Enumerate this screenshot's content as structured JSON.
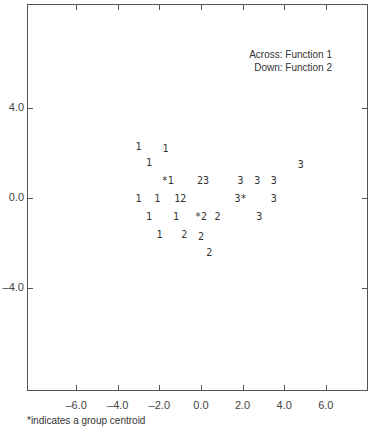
{
  "chart_data": {
    "type": "scatter",
    "title": "",
    "legend": [
      "Across: Function 1",
      "Down: Function 2"
    ],
    "xlabel": "Function 1",
    "ylabel": "Function 2",
    "x_ticks": [
      "-6.0",
      "-4.0",
      "-2.0",
      "0.0",
      "2.0",
      "4.0",
      "6.0"
    ],
    "y_ticks": [
      "4.0",
      "0.0",
      "-4.0"
    ],
    "xlim": [
      -8.2,
      8.2
    ],
    "ylim": [
      -8.5,
      8.5
    ],
    "grid": false,
    "footnote": "*indicates a group centroid",
    "points": [
      {
        "label": "1",
        "x": -3.0,
        "y": 2.3
      },
      {
        "label": "1",
        "x": -1.7,
        "y": 2.2
      },
      {
        "label": "1",
        "x": -2.5,
        "y": 1.6
      },
      {
        "label": "*1",
        "x": -1.6,
        "y": 0.8
      },
      {
        "label": "23",
        "x": 0.1,
        "y": 0.8
      },
      {
        "label": "3",
        "x": 1.9,
        "y": 0.8
      },
      {
        "label": "3",
        "x": 2.7,
        "y": 0.8
      },
      {
        "label": "3",
        "x": 3.5,
        "y": 0.8
      },
      {
        "label": "3",
        "x": 4.8,
        "y": 1.5
      },
      {
        "label": "1",
        "x": -3.0,
        "y": 0.0
      },
      {
        "label": "1",
        "x": -2.1,
        "y": 0.0
      },
      {
        "label": "12",
        "x": -1.0,
        "y": 0.0
      },
      {
        "label": "3*",
        "x": 1.9,
        "y": 0.0
      },
      {
        "label": "3",
        "x": 3.5,
        "y": 0.0
      },
      {
        "label": "1",
        "x": -2.5,
        "y": -0.8
      },
      {
        "label": "1",
        "x": -1.2,
        "y": -0.8
      },
      {
        "label": "*2",
        "x": 0.0,
        "y": -0.8
      },
      {
        "label": "2",
        "x": 0.8,
        "y": -0.8
      },
      {
        "label": "3",
        "x": 2.8,
        "y": -0.8
      },
      {
        "label": "1",
        "x": -2.0,
        "y": -1.6
      },
      {
        "label": "2",
        "x": -0.8,
        "y": -1.6
      },
      {
        "label": "2",
        "x": 0.0,
        "y": -1.7
      },
      {
        "label": "2",
        "x": 0.4,
        "y": -2.4
      }
    ]
  }
}
